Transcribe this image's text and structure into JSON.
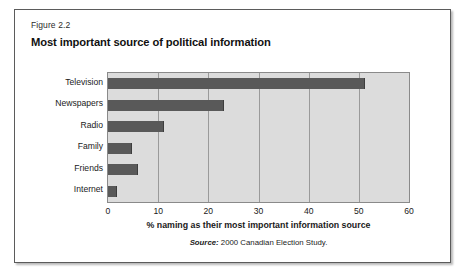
{
  "figure": {
    "number_label": "Figure 2.2",
    "title": "Most important source of political information",
    "source_prefix": "Source:",
    "source_text": "2000 Canadian Election Study."
  },
  "colors": {
    "bar": "#595959",
    "plot_background": "#dcdcdc",
    "gridline": "#9a9a9a",
    "frame_border": "#8a8a8a",
    "box_border": "#5b5b5b",
    "text": "#1a1a1a"
  },
  "chart_data": {
    "type": "bar",
    "orientation": "horizontal",
    "title": "Most important source of political information",
    "subtitle": "Figure 2.2",
    "categories": [
      "Television",
      "Newspapers",
      "Radio",
      "Family",
      "Friends",
      "Internet"
    ],
    "values": [
      51,
      23,
      11,
      4.5,
      5.7,
      1.5
    ],
    "series": [
      {
        "name": "% naming as their most important information source",
        "values": [
          51,
          23,
          11,
          4.5,
          5.7,
          1.5
        ]
      }
    ],
    "xlabel": "% naming as their most important information source",
    "ylabel": "",
    "xlim": [
      0,
      60
    ],
    "xticks": [
      0,
      10,
      20,
      30,
      40,
      50,
      60
    ],
    "xtick_labels": [
      "0",
      "10",
      "20",
      "30",
      "40",
      "50",
      "60"
    ],
    "grid": "vertical",
    "legend": "none",
    "annotations": [
      "Source: 2000 Canadian Election Study."
    ]
  }
}
